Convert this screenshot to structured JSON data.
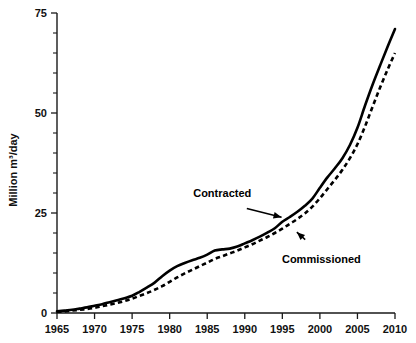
{
  "chart_data": {
    "type": "line",
    "title": "",
    "xlabel": "",
    "ylabel": "Million m³/day",
    "xlim": [
      1965,
      2010
    ],
    "ylim": [
      0,
      75
    ],
    "grid": false,
    "legend_position": "none",
    "x_ticks": [
      "1965",
      "1970",
      "1975",
      "1980",
      "1985",
      "1990",
      "1995",
      "2000",
      "2005",
      "2010"
    ],
    "y_ticks": [
      "0",
      "25",
      "50",
      "75"
    ],
    "y_minor_step": 5,
    "x": [
      1965,
      1966,
      1967,
      1968,
      1969,
      1970,
      1971,
      1972,
      1973,
      1974,
      1975,
      1976,
      1977,
      1978,
      1979,
      1980,
      1981,
      1982,
      1983,
      1984,
      1985,
      1986,
      1987,
      1988,
      1989,
      1990,
      1991,
      1992,
      1993,
      1994,
      1995,
      1996,
      1997,
      1998,
      1999,
      2000,
      2001,
      2002,
      2003,
      2004,
      2005,
      2006,
      2007,
      2008,
      2009,
      2010
    ],
    "series": [
      {
        "name": "Contracted",
        "style": "solid",
        "color": "#000000",
        "values": [
          0.4,
          0.6,
          0.8,
          1.1,
          1.4,
          1.8,
          2.2,
          2.7,
          3.2,
          3.7,
          4.3,
          5.3,
          6.4,
          7.6,
          9.2,
          10.6,
          11.7,
          12.5,
          13.2,
          13.8,
          14.6,
          15.6,
          15.9,
          16.1,
          16.6,
          17.4,
          18.2,
          19.1,
          20.1,
          21.2,
          22.8,
          24.0,
          25.3,
          26.8,
          28.6,
          31.3,
          33.9,
          36.2,
          38.7,
          42.0,
          46.3,
          51.8,
          57.0,
          61.8,
          66.5,
          71.0
        ]
      },
      {
        "name": "Commissioned",
        "style": "dashed",
        "color": "#000000",
        "values": [
          0.3,
          0.4,
          0.6,
          0.8,
          1.0,
          1.3,
          1.7,
          2.1,
          2.5,
          3.0,
          3.6,
          4.3,
          5.0,
          5.8,
          6.7,
          7.8,
          8.9,
          9.9,
          10.8,
          11.7,
          12.6,
          13.5,
          14.2,
          14.9,
          15.6,
          16.4,
          17.2,
          18.1,
          19.0,
          20.0,
          21.1,
          22.3,
          23.5,
          24.9,
          26.6,
          28.7,
          31.0,
          33.3,
          35.8,
          38.7,
          42.2,
          46.6,
          51.5,
          56.3,
          60.8,
          65.0
        ]
      }
    ],
    "annotations": [
      {
        "text": "Contracted",
        "label_x": 1987.0,
        "label_y": 29.0,
        "target_x": 1995.4,
        "target_y": 23.6
      },
      {
        "text": "Commissioned",
        "label_x": 2000.2,
        "label_y": 12.5,
        "target_x": 1996.6,
        "target_y": 21.0
      }
    ]
  }
}
